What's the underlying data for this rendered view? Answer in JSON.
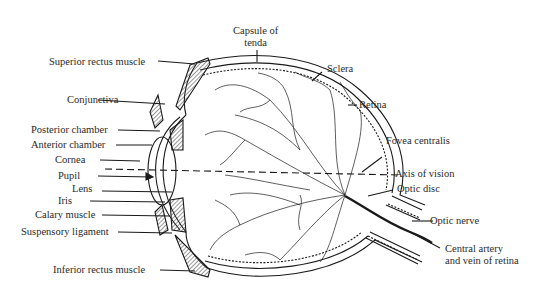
{
  "diagram": {
    "labels": {
      "capsule_of_tenda_1": "Capsule of",
      "capsule_of_tenda_2": "tenda",
      "superior_rectus": "Superior rectus muscle",
      "sclera": "Sclera",
      "retina": "Retina",
      "conjunctiva": "Conjunctiva",
      "posterior_chamber": "Posterior chamber",
      "anterior_chamber": "Anterior chamber",
      "cornea": "Cornea",
      "fovea_centralis": "Fovea centralis",
      "pupil": "Pupil",
      "axis_of_vision": "Axis of vision",
      "lens": "Lens",
      "optic_disc": "Optic disc",
      "iris": "Iris",
      "calary_muscle": "Calary muscle",
      "optic_nerve": "Optic nerve",
      "suspensory_ligament": "Suspensory ligament",
      "central_artery_1": "Central artery",
      "central_artery_2": "and vein of retina",
      "inferior_rectus": "Inferior rectus muscle"
    }
  }
}
